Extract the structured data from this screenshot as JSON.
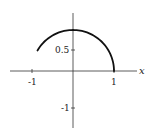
{
  "chart_data": {
    "type": "line",
    "title": "",
    "xlabel": "x",
    "ylabel": "",
    "xlim": [
      -1.55,
      1.6
    ],
    "ylim": [
      -1.35,
      1.4
    ],
    "grid": false,
    "legend": null,
    "x_ticks": [
      {
        "value": -1,
        "label": "-1"
      },
      {
        "value": 1,
        "label": "1"
      }
    ],
    "y_ticks": [
      {
        "value": 0.5,
        "label": "0.5"
      },
      {
        "value": -1,
        "label": "-1"
      }
    ],
    "series": [
      {
        "name": "unit circle arc",
        "description": "Arc of the unit circle from angle 0 to 5π/6 (endpoint near (-0.87, 0.5))",
        "x": [
          1,
          0.966,
          0.866,
          0.707,
          0.5,
          0.259,
          0,
          -0.259,
          -0.5,
          -0.707,
          -0.866
        ],
        "y": [
          0,
          0.259,
          0.5,
          0.707,
          0.866,
          0.966,
          1,
          0.966,
          0.866,
          0.707,
          0.5
        ],
        "color": "#111111"
      }
    ],
    "colors": {
      "axes": "#333333",
      "curve": "#111111",
      "background": "#ffffff"
    }
  }
}
